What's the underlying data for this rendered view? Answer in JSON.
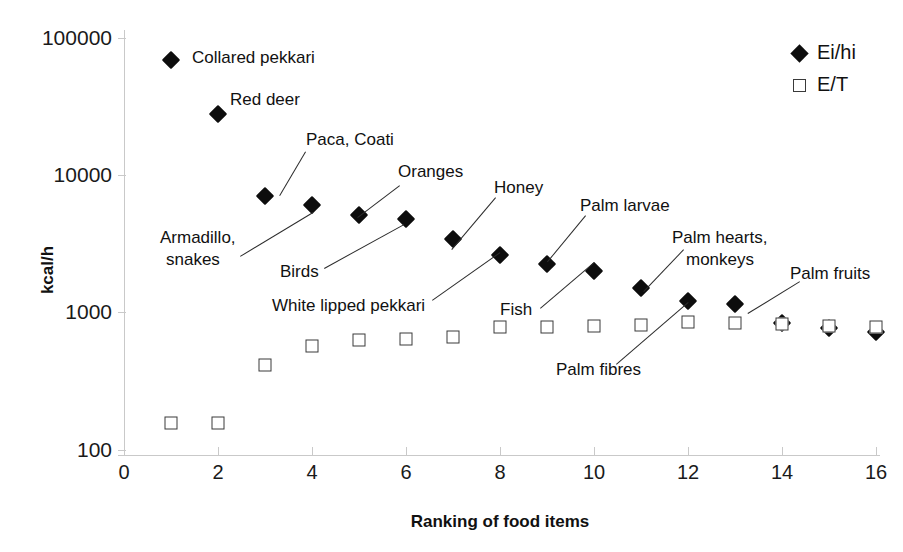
{
  "chart_data": {
    "type": "scatter",
    "title": "",
    "xlabel": "Ranking of food items",
    "ylabel": "kcal/h",
    "xlim": [
      0,
      16.6
    ],
    "ylim": [
      100,
      100000
    ],
    "yscale": "log",
    "xticks": [
      0,
      2,
      4,
      6,
      8,
      10,
      12,
      14,
      16
    ],
    "yticks": [
      100,
      1000,
      10000,
      100000
    ],
    "ytick_labels": [
      "100",
      "1000",
      "10000",
      "100000"
    ],
    "grid": false,
    "legend_position": "top-right",
    "series": [
      {
        "name": "Ei/hi",
        "marker": "filled-diamond",
        "color": "#0d0d0d",
        "x": [
          1,
          2,
          3,
          4,
          5,
          6,
          7,
          8,
          9,
          10,
          11,
          12,
          13,
          14,
          15,
          16
        ],
        "values": [
          69000,
          28000,
          7000,
          6000,
          5100,
          4800,
          3400,
          2600,
          2250,
          2000,
          1500,
          1200,
          1150,
          830,
          760,
          720
        ]
      },
      {
        "name": "E/T",
        "marker": "open-square",
        "color": "#3a3a3a",
        "x": [
          1,
          2,
          3,
          4,
          5,
          6,
          7,
          8,
          9,
          10,
          11,
          12,
          13,
          14,
          15,
          16
        ],
        "values": [
          155,
          155,
          410,
          560,
          620,
          630,
          660,
          780,
          780,
          790,
          800,
          840,
          830,
          820,
          790,
          780
        ]
      }
    ],
    "annotations": [
      {
        "text": "Collared pekkari",
        "x": 1,
        "y": 69000
      },
      {
        "text": "Red deer",
        "x": 2,
        "y": 28000
      },
      {
        "text": "Paca, Coati",
        "x": 3,
        "y": 7000
      },
      {
        "text": "Armadillo,\nsnakes",
        "x": 4,
        "y": 6000
      },
      {
        "text": "Oranges",
        "x": 5,
        "y": 5100
      },
      {
        "text": "Birds",
        "x": 6,
        "y": 4800
      },
      {
        "text": "White lipped pekkari",
        "x": 7,
        "y": 3400
      },
      {
        "text": "Honey",
        "x": 8,
        "y": 2600
      },
      {
        "text": "Fish",
        "x": 9,
        "y": 2250
      },
      {
        "text": "Palm larvae",
        "x": 10,
        "y": 2000
      },
      {
        "text": "Palm fibres",
        "x": 11,
        "y": 1500
      },
      {
        "text": "Palm hearts,\nmonkeys",
        "x": 12,
        "y": 1200
      },
      {
        "text": "Palm fruits",
        "x": 13,
        "y": 1150
      }
    ]
  },
  "axes": {
    "y_title": "kcal/h",
    "x_title": "Ranking of food items",
    "y_ticks": [
      "100000",
      "10000",
      "1000",
      "100"
    ],
    "x_ticks": [
      "0",
      "2",
      "4",
      "6",
      "8",
      "10",
      "12",
      "14",
      "16"
    ]
  },
  "legend": {
    "entries": [
      {
        "label": "Ei/hi",
        "marker": "filled-diamond"
      },
      {
        "label": "E/T",
        "marker": "open-square"
      }
    ]
  },
  "labels": {
    "collared_pekkari": "Collared pekkari",
    "red_deer": "Red deer",
    "paca_coati": "Paca, Coati",
    "oranges": "Oranges",
    "honey": "Honey",
    "palm_larvae": "Palm larvae",
    "palm_hearts_monkeys_1": "Palm hearts,",
    "palm_hearts_monkeys_2": "monkeys",
    "palm_fruits": "Palm fruits",
    "armadillo_snakes_1": "Armadillo,",
    "armadillo_snakes_2": "snakes",
    "birds": "Birds",
    "white_lipped_pekkari": "White lipped pekkari",
    "fish": "Fish",
    "palm_fibres": "Palm fibres"
  }
}
